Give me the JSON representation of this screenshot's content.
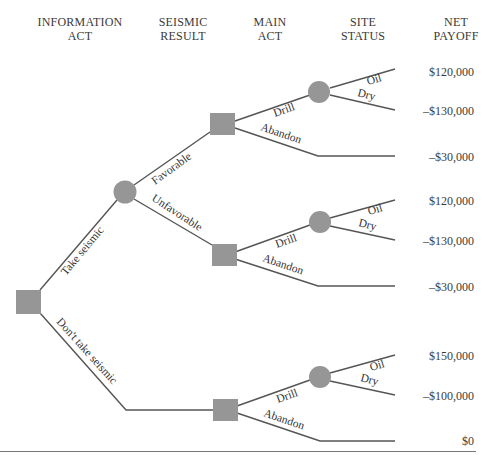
{
  "headers": [
    {
      "line1": "INFORMATION",
      "line2": "ACT"
    },
    {
      "line1": "SEISMIC",
      "line2": "RESULT"
    },
    {
      "line1": "MAIN",
      "line2": "ACT"
    },
    {
      "line1": "SITE",
      "line2": "STATUS"
    },
    {
      "line1": "NET",
      "line2": "PAYOFF"
    }
  ],
  "branches": {
    "take_seismic": "Take seismic",
    "dont_take_seismic": "Don't take seismic",
    "favorable": "Favorable",
    "unfavorable": "Unfavorable",
    "drill": "Drill",
    "abandon": "Abandon",
    "oil": "Oil",
    "dry": "Dry"
  },
  "payoffs": [
    "$120,000",
    "–$130,000",
    "–$30,000",
    "$120,000",
    "–$130,000",
    "–$30,000",
    "$150,000",
    "–$100,000",
    "$0"
  ],
  "colors": {
    "node_fill": "#969696",
    "line": "#555555"
  }
}
